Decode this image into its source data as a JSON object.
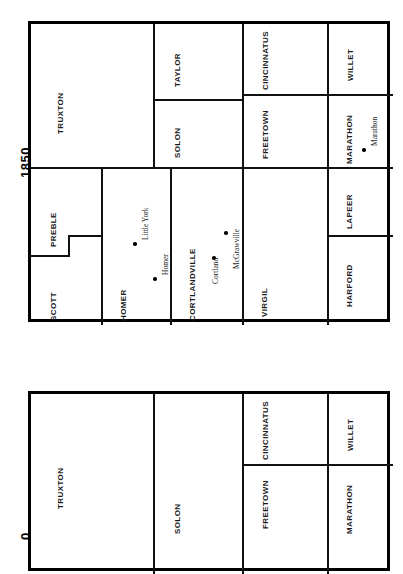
{
  "document": {
    "type": "historical-township-map-page",
    "orientation": "rotated-90-ccw",
    "maps": [
      {
        "year_label": "1850",
        "townships": [
          "TRUXTON",
          "TAYLOR",
          "SOLON",
          "CINCINNATUS",
          "FREETOWN",
          "WILLET",
          "MARATHON",
          "SCOTT",
          "PREBLE",
          "HOMER",
          "CORTLANDVILLE",
          "VIRGIL",
          "LAPEER",
          "HARFORD"
        ],
        "places": [
          "Little York",
          "Homer",
          "Cortland",
          "McGrawville",
          "Marathon"
        ]
      },
      {
        "year_label_partial": "0",
        "townships": [
          "TRUXTON",
          "SOLON",
          "CINCINNATUS",
          "FREETOWN",
          "WILLET",
          "MARATHON"
        ],
        "places": []
      }
    ]
  },
  "map1": {
    "year": "1850",
    "labels": {
      "truxton": "TRUXTON",
      "taylor": "TAYLOR",
      "solon": "SOLON",
      "cincinnatus": "CINCINNATUS",
      "freetown": "FREETOWN",
      "willet": "WILLET",
      "marathon": "MARATHON",
      "scott": "SCOTT",
      "preble": "PREBLE",
      "homer": "HOMER",
      "cortlandville": "CORTLANDVILLE",
      "virgil": "VIRGIL",
      "lapeer": "LAPEER",
      "harford": "HARFORD"
    },
    "places": {
      "little_york": "Little York",
      "homer": "Homer",
      "cortland": "Cortland",
      "mcgrawville": "McGrawville",
      "marathon": "Marathon"
    }
  },
  "map2": {
    "year": "0",
    "labels": {
      "truxton": "TRUXTON",
      "solon": "SOLON",
      "cincinnatus": "CINCINNATUS",
      "freetown": "FREETOWN",
      "willet": "WILLET",
      "marathon": "MARATHON"
    }
  },
  "colors": {
    "ink": "#111111",
    "paper": "#ffffff"
  }
}
